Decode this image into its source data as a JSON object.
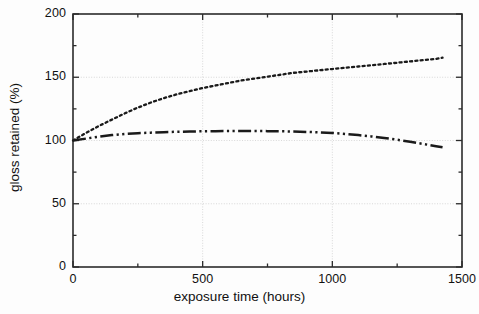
{
  "chart_data": {
    "type": "line",
    "title": "",
    "xlabel": "exposure time (hours)",
    "ylabel": "gloss retained (%)",
    "xlim": [
      0,
      1500
    ],
    "ylim": [
      0,
      200
    ],
    "xticks": [
      0,
      500,
      1000,
      1500
    ],
    "xtick_labels": [
      "0",
      "500",
      "1000",
      "1500"
    ],
    "xminor_ticks": [
      250,
      750,
      1250
    ],
    "yticks": [
      0,
      50,
      100,
      150,
      200
    ],
    "ytick_labels": [
      "0",
      "50",
      "100",
      "150",
      "200"
    ],
    "yminor_ticks": [
      25,
      75,
      125,
      175
    ],
    "grid": "major-xy-light",
    "legend": "none",
    "series": [
      {
        "name": "dotted-series",
        "style": "dotted",
        "color": "#1a1a1a",
        "x": [
          0,
          50,
          100,
          150,
          200,
          250,
          300,
          350,
          400,
          450,
          500,
          550,
          600,
          650,
          700,
          750,
          800,
          850,
          900,
          950,
          1000,
          1050,
          1100,
          1150,
          1200,
          1250,
          1300,
          1350,
          1400,
          1425
        ],
        "y": [
          100,
          106,
          111.5,
          116.5,
          121.5,
          126,
          130,
          133.5,
          136.5,
          139,
          141.5,
          143.5,
          145.5,
          147.5,
          149,
          150.5,
          152,
          153.5,
          154.5,
          155.5,
          156.5,
          157.5,
          158.5,
          159.5,
          160.5,
          161.5,
          162.5,
          163.5,
          164.5,
          165.5
        ]
      },
      {
        "name": "dash-dot-dot-series",
        "style": "dashdotdot",
        "color": "#1a1a1a",
        "x": [
          0,
          50,
          100,
          150,
          200,
          250,
          300,
          350,
          400,
          450,
          500,
          550,
          600,
          650,
          700,
          750,
          800,
          850,
          900,
          950,
          1000,
          1050,
          1100,
          1150,
          1200,
          1250,
          1300,
          1350,
          1400,
          1425
        ],
        "y": [
          100,
          101.5,
          103,
          104.3,
          105.2,
          105.8,
          106.2,
          106.6,
          106.9,
          107.1,
          107.3,
          107.4,
          107.5,
          107.5,
          107.5,
          107.4,
          107.3,
          107.1,
          106.8,
          106.4,
          106,
          105.2,
          104.3,
          103.2,
          102,
          100.6,
          99,
          97.3,
          95.5,
          94.6
        ]
      }
    ]
  },
  "axes": {
    "frame_color": "#2b2b2b",
    "grid_color": "#c8c8c8"
  }
}
